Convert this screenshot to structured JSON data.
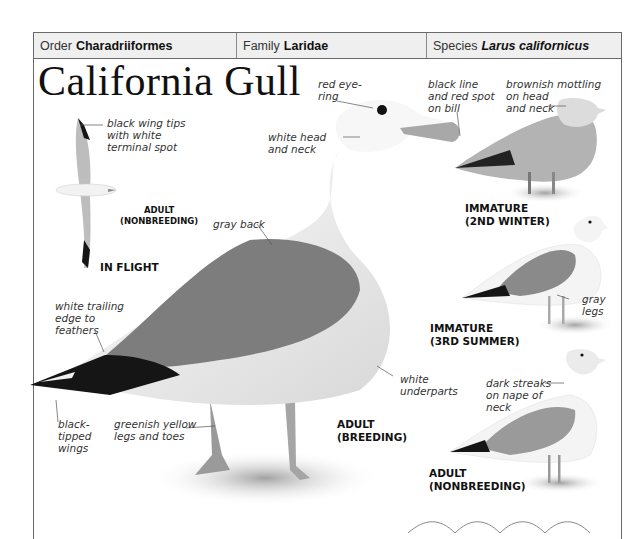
{
  "header": {
    "order": {
      "label": "Order",
      "value": "Charadriiformes"
    },
    "family": {
      "label": "Family",
      "value": "Laridae"
    },
    "species": {
      "label": "Species",
      "value": "Larus californicus"
    }
  },
  "title": "California Gull",
  "annotations": {
    "wing_tips": [
      "black wing tips",
      "with white",
      "terminal spot"
    ],
    "red_eye": [
      "red eye-",
      "ring"
    ],
    "bill": [
      "black line",
      "and red spot",
      "on bill"
    ],
    "mottling": [
      "brownish mottling",
      "on head",
      "and neck"
    ],
    "head_neck": [
      "white head",
      "and neck"
    ],
    "gray_back": [
      "gray back"
    ],
    "trailing_edge": [
      "white trailing",
      "edge to",
      "feathers"
    ],
    "gray_legs": [
      "gray",
      "legs"
    ],
    "underparts": [
      "white",
      "underparts"
    ],
    "dark_streaks": [
      "dark streaks",
      "on nape of",
      "neck"
    ],
    "black_tipped": [
      "black-",
      "tipped",
      "wings"
    ],
    "legs_toes": [
      "greenish yellow",
      "legs and toes"
    ]
  },
  "labels": {
    "flight_adult": [
      "ADULT",
      "(NONBREEDING)"
    ],
    "in_flight": "IN FLIGHT",
    "immature_2nd": [
      "IMMATURE",
      "(2ND WINTER)"
    ],
    "immature_3rd": [
      "IMMATURE",
      "(3RD SUMMER)"
    ],
    "adult_breeding": [
      "ADULT",
      "(BREEDING)"
    ],
    "adult_nonbreeding": [
      "ADULT",
      "(NONBREEDING)"
    ]
  },
  "colors": {
    "frame": "#6a6a6a",
    "header_bg": "#efefef",
    "gull_gray": "#8c8c8c",
    "wing_black": "#151515"
  }
}
